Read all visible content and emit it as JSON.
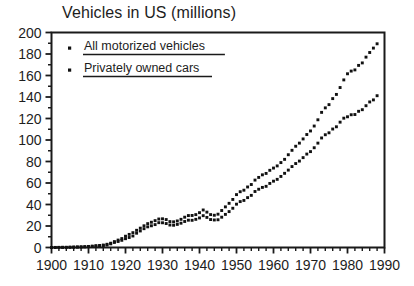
{
  "chart_data": {
    "type": "scatter",
    "title": "Vehicles in US (millions)",
    "xlabel": "",
    "ylabel": "",
    "xlim": [
      1900,
      1990
    ],
    "ylim": [
      0,
      200
    ],
    "grid": false,
    "legend_position": "top-left",
    "y_ticks": [
      0,
      20,
      40,
      60,
      80,
      100,
      120,
      140,
      160,
      180,
      200
    ],
    "y_minor_tick_step": 10,
    "x_ticks": [
      1900,
      1910,
      1920,
      1930,
      1940,
      1950,
      1960,
      1970,
      1980,
      1990
    ],
    "x_minor_tick_step": 2,
    "marker": "filled-square",
    "series": [
      {
        "name": "All motorized vehicles",
        "color": "#111111",
        "x": [
          1900,
          1901,
          1902,
          1903,
          1904,
          1905,
          1906,
          1907,
          1908,
          1909,
          1910,
          1911,
          1912,
          1913,
          1914,
          1915,
          1916,
          1917,
          1918,
          1919,
          1920,
          1921,
          1922,
          1923,
          1924,
          1925,
          1926,
          1927,
          1928,
          1929,
          1930,
          1931,
          1932,
          1933,
          1934,
          1935,
          1936,
          1937,
          1938,
          1939,
          1940,
          1941,
          1942,
          1943,
          1944,
          1945,
          1946,
          1947,
          1948,
          1949,
          1950,
          1951,
          1952,
          1953,
          1954,
          1955,
          1956,
          1957,
          1958,
          1959,
          1960,
          1961,
          1962,
          1963,
          1964,
          1965,
          1966,
          1967,
          1968,
          1969,
          1970,
          1971,
          1972,
          1973,
          1974,
          1975,
          1976,
          1977,
          1978,
          1979,
          1980,
          1981,
          1982,
          1983,
          1984,
          1985,
          1986,
          1987,
          1988
        ],
        "values": [
          0.0,
          0.1,
          0.1,
          0.2,
          0.2,
          0.3,
          0.4,
          0.5,
          0.6,
          0.8,
          1.0,
          1.3,
          1.7,
          1.9,
          2.3,
          3.0,
          4.0,
          5.5,
          6.9,
          8.3,
          10.5,
          12.2,
          13.8,
          16.0,
          18.0,
          20.2,
          22.2,
          23.5,
          25.0,
          26.5,
          26.7,
          26.0,
          24.1,
          23.9,
          24.7,
          26.2,
          28.2,
          29.7,
          29.8,
          30.6,
          32.4,
          34.9,
          32.9,
          30.6,
          30.0,
          31.0,
          34.4,
          37.8,
          41.1,
          44.7,
          49.2,
          51.9,
          53.3,
          56.3,
          58.6,
          62.7,
          65.2,
          67.6,
          68.9,
          71.8,
          73.9,
          75.9,
          79.0,
          82.0,
          86.3,
          90.4,
          94.2,
          97.1,
          101.0,
          105.1,
          108.4,
          113.0,
          118.8,
          125.7,
          129.9,
          132.9,
          138.5,
          142.4,
          148.8,
          155.9,
          161.6,
          164.1,
          165.2,
          169.4,
          171.7,
          177.1,
          181.4,
          185.5,
          189.5
        ]
      },
      {
        "name": "Privately owned cars",
        "color": "#111111",
        "x": [
          1900,
          1901,
          1902,
          1903,
          1904,
          1905,
          1906,
          1907,
          1908,
          1909,
          1910,
          1911,
          1912,
          1913,
          1914,
          1915,
          1916,
          1917,
          1918,
          1919,
          1920,
          1921,
          1922,
          1923,
          1924,
          1925,
          1926,
          1927,
          1928,
          1929,
          1930,
          1931,
          1932,
          1933,
          1934,
          1935,
          1936,
          1937,
          1938,
          1939,
          1940,
          1941,
          1942,
          1943,
          1944,
          1945,
          1946,
          1947,
          1948,
          1949,
          1950,
          1951,
          1952,
          1953,
          1954,
          1955,
          1956,
          1957,
          1958,
          1959,
          1960,
          1961,
          1962,
          1963,
          1964,
          1965,
          1966,
          1967,
          1968,
          1969,
          1970,
          1971,
          1972,
          1973,
          1974,
          1975,
          1976,
          1977,
          1978,
          1979,
          1980,
          1981,
          1982,
          1983,
          1984,
          1985,
          1986,
          1987,
          1988
        ],
        "values": [
          0.0,
          0.0,
          0.1,
          0.1,
          0.1,
          0.2,
          0.3,
          0.4,
          0.5,
          0.6,
          0.8,
          1.0,
          1.2,
          1.5,
          1.8,
          2.3,
          3.4,
          4.7,
          5.6,
          6.7,
          8.2,
          9.3,
          10.7,
          13.3,
          15.4,
          17.5,
          19.2,
          20.2,
          21.3,
          23.1,
          23.0,
          22.3,
          20.9,
          20.7,
          21.5,
          22.6,
          24.2,
          25.4,
          25.3,
          26.2,
          27.5,
          29.6,
          28.0,
          26.0,
          25.6,
          25.8,
          28.2,
          30.8,
          33.4,
          36.5,
          40.3,
          42.7,
          43.8,
          46.4,
          48.5,
          52.1,
          54.2,
          55.9,
          56.9,
          59.6,
          61.7,
          63.4,
          66.1,
          69.0,
          72.0,
          75.3,
          78.1,
          80.4,
          83.6,
          86.9,
          89.2,
          92.8,
          97.1,
          101.9,
          104.9,
          106.7,
          110.2,
          112.3,
          116.6,
          120.3,
          121.6,
          123.5,
          123.7,
          126.7,
          128.2,
          131.9,
          135.4,
          137.3,
          141.2
        ]
      }
    ]
  },
  "legend": {
    "items": [
      {
        "label": "All motorized vehicles",
        "marker": "square-dot"
      },
      {
        "label": "Privately owned cars",
        "marker": "square-dot"
      }
    ]
  },
  "colors": {
    "background": "#ffffff",
    "ink": "#1a1a1a",
    "marker": "#111111"
  }
}
